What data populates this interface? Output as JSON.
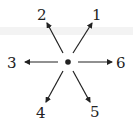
{
  "diagram": {
    "center": {
      "x": 68,
      "y": 62
    },
    "directions": [
      {
        "label": "1",
        "tip": {
          "x": 92,
          "y": 23
        },
        "label_pos": {
          "x": 96,
          "y": 20
        }
      },
      {
        "label": "2",
        "tip": {
          "x": 47,
          "y": 23
        },
        "label_pos": {
          "x": 41,
          "y": 20
        }
      },
      {
        "label": "3",
        "tip": {
          "x": 25,
          "y": 62
        },
        "label_pos": {
          "x": 12,
          "y": 67
        }
      },
      {
        "label": "4",
        "tip": {
          "x": 46,
          "y": 102
        },
        "label_pos": {
          "x": 40,
          "y": 118
        }
      },
      {
        "label": "5",
        "tip": {
          "x": 90,
          "y": 102
        },
        "label_pos": {
          "x": 95,
          "y": 117
        }
      },
      {
        "label": "6",
        "tip": {
          "x": 112,
          "y": 62
        },
        "label_pos": {
          "x": 121,
          "y": 68
        }
      }
    ],
    "colors": {
      "ink": "#222222",
      "background": "#ffffff"
    }
  }
}
